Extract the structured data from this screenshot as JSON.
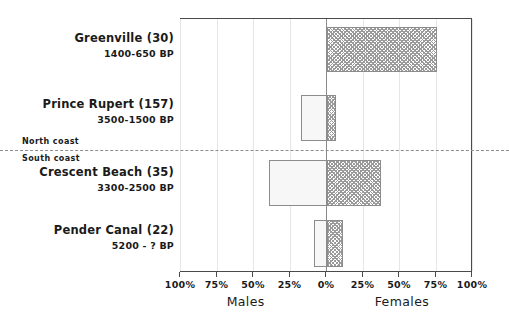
{
  "chart_data": {
    "type": "bar",
    "orientation": "horizontal-diverging",
    "title": "",
    "xlabel_left": "Males",
    "xlabel_right": "Females",
    "ylabel": "",
    "xlim": [
      -100,
      100
    ],
    "grid": true,
    "legend": "none",
    "axis_tick_values": [
      -100,
      -75,
      -50,
      -25,
      0,
      25,
      50,
      75,
      100
    ],
    "axis_tick_labels": [
      "100%",
      "75%",
      "50%",
      "25%",
      "0%",
      "25%",
      "50%",
      "75%",
      "100%"
    ],
    "categories": [
      "Greenville (30)",
      "Prince Rupert (157)",
      "Crescent Beach (35)",
      "Pender Canal (22)"
    ],
    "series": [
      {
        "name": "Males",
        "values": [
          0,
          -18,
          -40,
          -9
        ]
      },
      {
        "name": "Females",
        "values": [
          75,
          6,
          37,
          11
        ]
      }
    ],
    "annotations": [
      "North coast",
      "South coast"
    ]
  },
  "rows": [
    {
      "site": "Greenville (30)",
      "date": "1400-650 BP",
      "male_pct": 0,
      "female_pct": 75,
      "label_top": 32,
      "bar_top": 26,
      "bar_height": 45
    },
    {
      "site": "Prince Rupert (157)",
      "date": "3500-1500 BP",
      "male_pct": -18,
      "female_pct": 6,
      "label_top": 98,
      "bar_top": 94,
      "bar_height": 46
    },
    {
      "site": "Crescent Beach (35)",
      "date": "3300-2500 BP",
      "male_pct": -40,
      "female_pct": 37,
      "label_top": 166,
      "bar_top": 159,
      "bar_height": 46
    },
    {
      "site": "Pender Canal (22)",
      "date": "5200 - ? BP",
      "male_pct": -9,
      "female_pct": 11,
      "label_top": 224,
      "bar_top": 219,
      "bar_height": 47
    }
  ],
  "divider": {
    "north_label": "North coast",
    "south_label": "South coast",
    "y": 150
  },
  "axis": {
    "ticks": [
      {
        "label": "100%",
        "value": -100
      },
      {
        "label": "75%",
        "value": -75
      },
      {
        "label": "50%",
        "value": -50
      },
      {
        "label": "25%",
        "value": -25
      },
      {
        "label": "0%",
        "value": 0
      },
      {
        "label": "25%",
        "value": 25
      },
      {
        "label": "50%",
        "value": 50
      },
      {
        "label": "75%",
        "value": 75
      },
      {
        "label": "100%",
        "value": 100
      }
    ],
    "left_title": "Males",
    "right_title": "Females",
    "left_title_value": -55,
    "right_title_value": 52
  },
  "colors": {
    "frame": "#4a4a4a",
    "grid": "#e6e6e6",
    "zero_line": "#8a8a8a",
    "bar_border": "#8c8c8c",
    "male_fill": "#f7f7f7",
    "female_hatch": "#9a9a9a",
    "text": "#1a1a1a"
  }
}
